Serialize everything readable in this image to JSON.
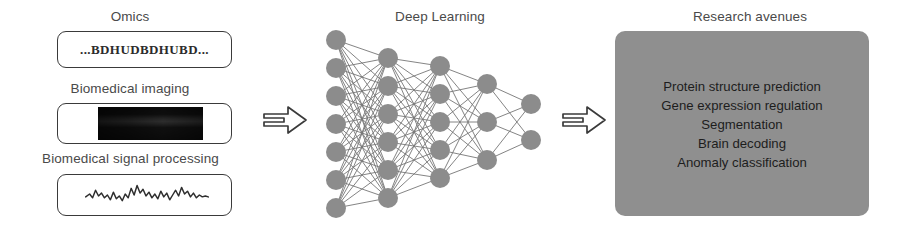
{
  "figure": {
    "background_color": "#ffffff"
  },
  "inputs": {
    "section_label": "Input modalities",
    "items": [
      {
        "label": "Omics",
        "icon": "dna-sequence-icon",
        "content_text": "...BDHUDBDHUBD..."
      },
      {
        "label": "Biomedical imaging",
        "icon": "ultrasound-image-icon",
        "content_text": ""
      },
      {
        "label": "Biomedical signal processing",
        "icon": "eeg-waveform-icon",
        "content_text": ""
      }
    ]
  },
  "arrows": [
    {
      "name": "arrow-inputs-to-model",
      "glyph": "double-line-right-arrow"
    },
    {
      "name": "arrow-model-to-outputs",
      "glyph": "double-line-right-arrow"
    }
  ],
  "model": {
    "label": "Deep Learning",
    "node_color": "#8c8c8c",
    "edge_color": "#6b6b6b",
    "layer_sizes": [
      7,
      6,
      5,
      3,
      2
    ]
  },
  "outputs": {
    "label": "Research avenues",
    "panel_color": "#8f8f8f",
    "items": [
      "Protein structure prediction",
      "Gene expression regulation",
      "Segmentation",
      "Brain decoding",
      "Anomaly classification"
    ]
  }
}
